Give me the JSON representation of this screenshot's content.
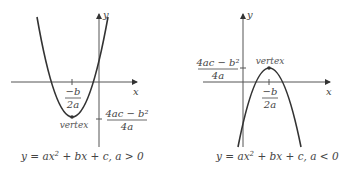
{
  "colors": {
    "curve": "#333333",
    "axis": "#555555",
    "text": "#444444"
  },
  "graphs": [
    {
      "id": "left",
      "axis_x_label": "x",
      "axis_y_label": "y",
      "vertex_label": "vertex",
      "h_num": "−b",
      "h_den": "2a",
      "k_num": "4ac − b²",
      "k_den": "4a",
      "caption_pre": "y = ax",
      "caption_sup": "2",
      "caption_post": " + bx + c, a > 0"
    },
    {
      "id": "right",
      "axis_x_label": "x",
      "axis_y_label": "y",
      "vertex_label": "vertex",
      "h_num": "−b",
      "h_den": "2a",
      "k_num": "4ac − b²",
      "k_den": "4a",
      "caption_pre": "y = ax",
      "caption_sup": "2",
      "caption_post": " + bx + c, a < 0"
    }
  ]
}
